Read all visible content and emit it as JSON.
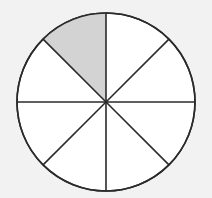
{
  "diagram": {
    "type": "fraction-circle",
    "total_parts": 8,
    "shaded_parts": 1,
    "shaded_sector_index": 0,
    "center": [
      106,
      102
    ],
    "radius": 89,
    "colors": {
      "background": "#f2f2f2",
      "fill": "#ffffff",
      "shaded": "#d3d3d3",
      "stroke": "#2a2a2a"
    }
  }
}
